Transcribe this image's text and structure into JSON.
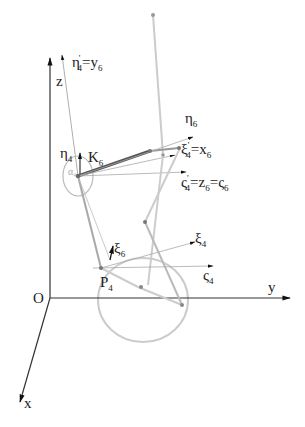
{
  "diagram": {
    "type": "kinematic-coordinate-frames",
    "colors": {
      "axis": "#333333",
      "link_dark": "#555555",
      "link_light": "#bbbbbb",
      "thin": "#999999",
      "circle": "#cccccc",
      "joint": "#777777"
    },
    "origin_label": "O",
    "axes": {
      "x": "x",
      "y": "y",
      "z": "z"
    },
    "labels": {
      "eta4p_y6": {
        "base": "η",
        "sup": "'",
        "sub": "4",
        "rest": "=y",
        "rest_sub": "6"
      },
      "eta4": {
        "base": "η",
        "sub": "4"
      },
      "alpha4": {
        "base": "α",
        "sub": "4"
      },
      "K6": {
        "base": "K",
        "sub": "6"
      },
      "eta6": {
        "base": "η",
        "sub": "6"
      },
      "xi4p_x6": {
        "base": "ξ",
        "sup": "'",
        "sub": "4",
        "rest": "=x",
        "rest_sub": "6"
      },
      "zeta4p_z6_zeta6": {
        "base": "ς",
        "sup": "'",
        "sub": "4",
        "rest1": "=z",
        "rest1_sub": "6",
        "rest2": "=ς",
        "rest2_sub": "6"
      },
      "xi6": {
        "base": "ξ",
        "sub": "6"
      },
      "xi4": {
        "base": "ξ",
        "sub": "4"
      },
      "zeta4": {
        "base": "ς",
        "sub": "4"
      },
      "P4": {
        "base": "P",
        "sub": "4"
      }
    }
  }
}
